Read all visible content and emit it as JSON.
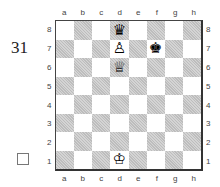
{
  "puzzle_number": "31",
  "to_move_indicator": "",
  "files": [
    "a",
    "b",
    "c",
    "d",
    "e",
    "f",
    "g",
    "h"
  ],
  "ranks": [
    "8",
    "7",
    "6",
    "5",
    "4",
    "3",
    "2",
    "1"
  ],
  "pieces": {
    "d8": {
      "glyph": "♛",
      "name": "black-queen"
    },
    "d7": {
      "glyph": "♙",
      "name": "white-pawn"
    },
    "f7": {
      "glyph": "♚",
      "name": "black-king"
    },
    "d6": {
      "glyph": "♕",
      "name": "white-queen"
    },
    "d1": {
      "glyph": "♔",
      "name": "white-king"
    }
  }
}
